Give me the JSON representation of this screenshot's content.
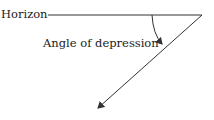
{
  "diagram": {
    "labels": {
      "horizon": "Horizon",
      "angle": "Angle of depression"
    },
    "colors": {
      "line": "#333333",
      "text": "#222222"
    }
  }
}
